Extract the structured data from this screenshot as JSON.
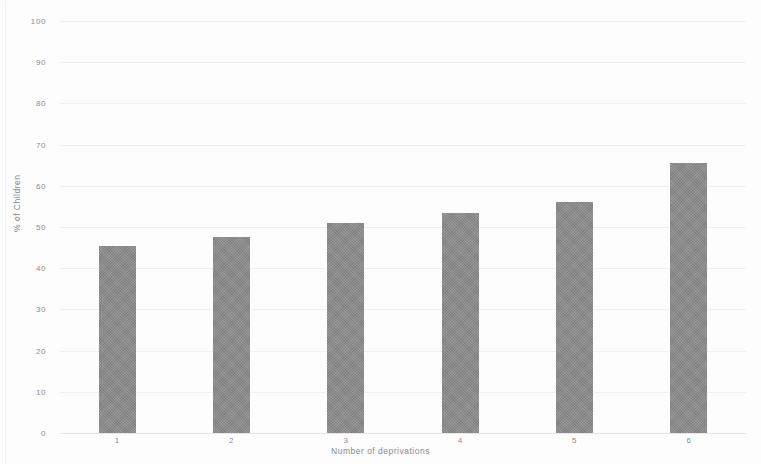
{
  "chart_data": {
    "type": "bar",
    "title": "",
    "subtitle": "",
    "xlabel": "Number of deprivations",
    "ylabel": "% of Children",
    "categories": [
      "1",
      "2",
      "3",
      "4",
      "5",
      "6"
    ],
    "values": [
      45.5,
      47.5,
      51,
      53.5,
      56,
      65.5
    ],
    "series": [
      {
        "name": "% of Children",
        "values": [
          45.5,
          47.5,
          51,
          53.5,
          56,
          65.5
        ]
      }
    ],
    "ylim": [
      0,
      100
    ],
    "yticks": [
      0,
      10,
      20,
      30,
      40,
      50,
      60,
      70,
      80,
      90,
      100
    ],
    "ytick_labels": [
      "0",
      "10",
      "20",
      "30",
      "40",
      "50",
      "60",
      "70",
      "80",
      "90",
      "100"
    ],
    "grid": true,
    "grid_axis": "y",
    "legend": false,
    "legend_position": "none",
    "bar_color": "#8b8b8b",
    "gridline_color": "#f0f0f2",
    "text_color": "#8a8a8c",
    "background_color": "#fdfdfe"
  }
}
